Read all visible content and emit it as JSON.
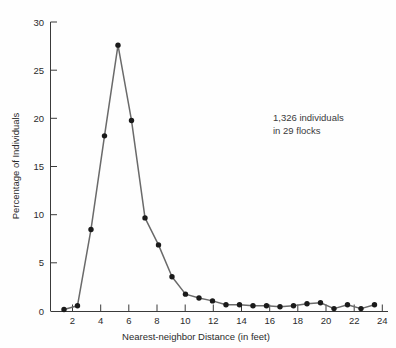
{
  "chart_data": {
    "type": "line",
    "title": "",
    "subtitle": "",
    "xlabel": "Nearest-neighbor Distance (in feet)",
    "ylabel": "Percentage of Individuals",
    "xlim": [
      0,
      25
    ],
    "ylim": [
      0,
      30
    ],
    "grid": false,
    "legend": null,
    "legend_position": "none",
    "marker": "filled-circle",
    "line_color": "#6a6a6a",
    "marker_color": "#1a1a1a",
    "axis_color": "#3a3a3a",
    "x": [
      1,
      2,
      3,
      4,
      5,
      6,
      7,
      8,
      9,
      10,
      11,
      12,
      13,
      14,
      15,
      16,
      17,
      18,
      19,
      20,
      21,
      22,
      23,
      24
    ],
    "values": [
      0.2,
      0.6,
      8.5,
      18.2,
      27.6,
      19.8,
      9.7,
      6.9,
      3.6,
      1.8,
      1.4,
      1.1,
      0.7,
      0.7,
      0.6,
      0.6,
      0.5,
      0.6,
      0.8,
      0.9,
      0.3,
      0.7,
      0.3,
      0.7
    ],
    "series": [
      {
        "name": "Percentage of Individuals",
        "values": [
          0.2,
          0.6,
          8.5,
          18.2,
          27.6,
          19.8,
          9.7,
          6.9,
          3.6,
          1.8,
          1.4,
          1.1,
          0.7,
          0.7,
          0.6,
          0.6,
          0.5,
          0.6,
          0.8,
          0.9,
          0.3,
          0.7,
          0.3,
          0.7
        ]
      }
    ],
    "xticks": [
      2,
      4,
      6,
      8,
      10,
      12,
      14,
      16,
      18,
      20,
      22,
      24
    ],
    "xtick_labels": [
      "2",
      "4",
      "6",
      "8",
      "10",
      "12",
      "14",
      "16",
      "18",
      "20",
      "22",
      "24"
    ],
    "yticks": [
      0,
      5,
      10,
      15,
      20,
      25,
      30
    ],
    "ytick_labels": [
      "0",
      "5",
      "10",
      "15",
      "20",
      "25",
      "30"
    ],
    "annotations": [
      {
        "name": "sample-size-note",
        "line1": "1,326 individuals",
        "line2": "in 29 flocks"
      }
    ]
  }
}
